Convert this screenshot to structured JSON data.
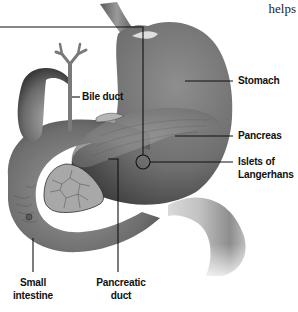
{
  "figure": {
    "corner_text": "helps",
    "colors": {
      "background": "#ffffff",
      "organ_dark": "#4a4a4a",
      "organ_mid": "#8a8a8a",
      "organ_light": "#cfcfcf",
      "leader_line": "#111111",
      "label_text": "#111111"
    },
    "labels": {
      "stomach": "Stomach",
      "bile_duct": "Bile duct",
      "pancreas": "Pancreas",
      "islets_line1": "Islets of",
      "islets_line2": "Langerhans",
      "small_intestine_line1": "Small",
      "small_intestine_line2": "intestine",
      "pancreatic_duct_line1": "Pancreatic",
      "pancreatic_duct_line2": "duct"
    }
  }
}
